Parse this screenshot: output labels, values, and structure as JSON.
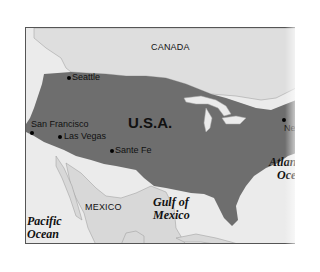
{
  "map": {
    "title": "U.S.A. map",
    "colors": {
      "usa": "#6e6e6e",
      "land": "#dcdcdc",
      "water": "#ebebeb",
      "border": "#555555"
    },
    "countries": [
      {
        "name": "CANADA"
      },
      {
        "name": "U.S.A."
      },
      {
        "name": "MEXICO"
      }
    ],
    "cities": [
      {
        "name": "Seattle"
      },
      {
        "name": "San Francisco"
      },
      {
        "name": "Las Vegas"
      },
      {
        "name": "Sante Fe"
      },
      {
        "name": "Nev"
      }
    ],
    "water_bodies": [
      {
        "line1": "Pacific",
        "line2": "Ocean"
      },
      {
        "line1": "Gulf of",
        "line2": "Mexico"
      },
      {
        "line1": "Atlan",
        "line2": "Oce"
      }
    ]
  }
}
